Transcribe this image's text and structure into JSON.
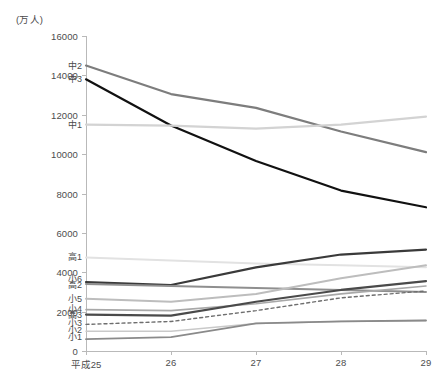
{
  "chart_data": {
    "type": "line",
    "title": "",
    "subtitle": "",
    "xlabel": "",
    "ylabel": "",
    "unit_label": "(万人)",
    "x": [
      "平成25",
      "26",
      "27",
      "28",
      "29"
    ],
    "categories": [
      "平成25",
      "26",
      "27",
      "28",
      "29"
    ],
    "ylim": [
      0,
      16000
    ],
    "y_ticks": [
      0,
      2000,
      4000,
      6000,
      8000,
      10000,
      12000,
      14000,
      16000
    ],
    "y_tick_labels": [
      "0",
      "2000",
      "4000",
      "6000",
      "8000",
      "10000",
      "12000",
      "14000",
      "16000"
    ],
    "grid": false,
    "legend": "inline-left-labels",
    "series": [
      {
        "name": "中2",
        "values": [
          14500,
          13050,
          12350,
          11150,
          10100
        ],
        "color": "#7d7d7d",
        "width": 2.2,
        "dash": ""
      },
      {
        "name": "中3",
        "values": [
          13800,
          11450,
          9650,
          8150,
          7300
        ],
        "color": "#111111",
        "width": 2.2,
        "dash": ""
      },
      {
        "name": "中1",
        "values": [
          11500,
          11450,
          11300,
          11500,
          11900
        ],
        "color": "#d3d3d3",
        "width": 2.2,
        "dash": ""
      },
      {
        "name": "高1",
        "values": [
          4750,
          4600,
          4450,
          4350,
          4250
        ],
        "color": "#e2e2e2",
        "width": 2.0,
        "dash": ""
      },
      {
        "name": "小6",
        "values": [
          3500,
          3350,
          4250,
          4900,
          5150
        ],
        "color": "#3a3a3a",
        "width": 2.2,
        "dash": ""
      },
      {
        "name": "高2",
        "values": [
          3400,
          3300,
          3200,
          3100,
          3000
        ],
        "color": "#8f8f8f",
        "width": 2.0,
        "dash": ""
      },
      {
        "name": "小5",
        "values": [
          2650,
          2500,
          2900,
          3700,
          4350
        ],
        "color": "#bdbdbd",
        "width": 2.0,
        "dash": ""
      },
      {
        "name": "小4",
        "values": [
          2100,
          2050,
          2400,
          2900,
          3300
        ],
        "color": "#a8a8a8",
        "width": 1.6,
        "dash": ""
      },
      {
        "name": "高3",
        "values": [
          1850,
          1800,
          2500,
          3100,
          3550
        ],
        "color": "#4a4a4a",
        "width": 2.2,
        "dash": ""
      },
      {
        "name": "小3",
        "values": [
          1350,
          1500,
          2050,
          2700,
          3050
        ],
        "color": "#6e6e6e",
        "width": 1.4,
        "dash": "3 3"
      },
      {
        "name": "小2",
        "values": [
          1000,
          1000,
          1400,
          1500,
          1550
        ],
        "color": "#c9c9c9",
        "width": 1.4,
        "dash": ""
      },
      {
        "name": "小1",
        "values": [
          600,
          700,
          1400,
          1500,
          1550
        ],
        "color": "#8a8a8a",
        "width": 1.8,
        "dash": ""
      }
    ],
    "series_label_positions": [
      {
        "name": "中2",
        "value": 14500
      },
      {
        "name": "中3",
        "value": 13800
      },
      {
        "name": "中1",
        "value": 11500
      },
      {
        "name": "高1",
        "value": 4750
      },
      {
        "name": "小6",
        "value": 3650
      },
      {
        "name": "高2",
        "value": 3330
      },
      {
        "name": "小5",
        "value": 2650
      },
      {
        "name": "小4",
        "value": 2150
      },
      {
        "name": "高3",
        "value": 1830
      },
      {
        "name": "小3",
        "value": 1400
      },
      {
        "name": "小2",
        "value": 1050
      },
      {
        "name": "小1",
        "value": 700
      }
    ]
  }
}
